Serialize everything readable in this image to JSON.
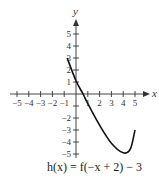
{
  "chart_data": {
    "type": "line",
    "title": "",
    "caption": "h(x) = f(−x + 2) − 3",
    "xlabel": "x",
    "ylabel": "y",
    "xlim": [
      -5,
      5
    ],
    "ylim": [
      -5,
      5
    ],
    "x_ticks": [
      -5,
      -4,
      -3,
      -2,
      -1,
      1,
      2,
      3,
      4,
      5
    ],
    "y_ticks": [
      -5,
      -4,
      -3,
      -2,
      -1,
      1,
      2,
      3,
      4,
      5
    ],
    "y_tick_labels_shown": [
      5,
      4,
      3,
      2,
      1,
      -2,
      -3,
      -4,
      -5
    ],
    "grid": false,
    "series": [
      {
        "name": "h(x)",
        "points": [
          [
            -0.75,
            3
          ],
          [
            0,
            1.1
          ],
          [
            0.6,
            0
          ],
          [
            1,
            -0.8
          ],
          [
            2,
            -2.6
          ],
          [
            3,
            -4.1
          ],
          [
            4,
            -4.9
          ],
          [
            4.6,
            -4.6
          ],
          [
            5,
            -3
          ]
        ]
      }
    ]
  },
  "labels": {
    "x_axis": "x",
    "y_axis": "y",
    "caption": "h(x) = f(−x + 2) − 3"
  }
}
